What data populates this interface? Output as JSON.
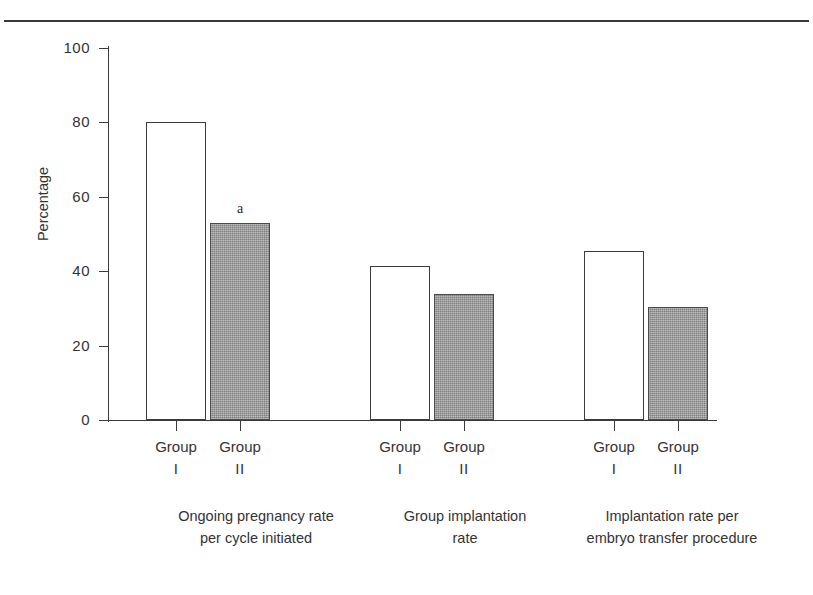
{
  "figure": {
    "y_axis_title": "Percentage",
    "y_ticks": [
      "100",
      "80",
      "60",
      "40",
      "20",
      "0"
    ],
    "group_label_line1": "Group",
    "group_label_roman_1": "I",
    "group_label_roman_2": "II",
    "note_marker": "a",
    "axis_color": "#3b3b3b",
    "bar_fill_open": "#ffffff",
    "bar_fill_shaded": "#9b9b9b",
    "series": [
      {
        "caption_line1": "Ongoing pregnancy rate",
        "caption_line2": "per cycle initiated",
        "bars": [
          {
            "label": "Group I",
            "value": 80.0,
            "style": "open",
            "note": ""
          },
          {
            "label": "Group II",
            "value": 53.0,
            "style": "filled",
            "note": "a"
          }
        ]
      },
      {
        "caption_line1": "Group implantation",
        "caption_line2": "rate",
        "bars": [
          {
            "label": "Group I",
            "value": 41.5,
            "style": "open",
            "note": ""
          },
          {
            "label": "Group II",
            "value": 33.8,
            "style": "filled",
            "note": ""
          }
        ]
      },
      {
        "caption_line1": "Implantation rate per",
        "caption_line2": "embryo transfer procedure",
        "bars": [
          {
            "label": "Group I",
            "value": 45.5,
            "style": "open",
            "note": ""
          },
          {
            "label": "Group II",
            "value": 30.5,
            "style": "filled",
            "note": ""
          }
        ]
      }
    ]
  },
  "chart_data": {
    "type": "bar",
    "title": "",
    "xlabel": "",
    "ylabel": "Percentage",
    "ylim": [
      0,
      100
    ],
    "yticks": [
      0,
      20,
      40,
      60,
      80,
      100
    ],
    "grid": false,
    "legend": "none",
    "categories": [
      "Ongoing pregnancy rate per cycle initiated",
      "Group implantation rate",
      "Implantation rate per embryo transfer procedure"
    ],
    "series": [
      {
        "name": "Group I",
        "values": [
          80.0,
          41.5,
          45.5
        ],
        "fill": "open"
      },
      {
        "name": "Group II",
        "values": [
          53.0,
          33.8,
          30.5
        ],
        "fill": "shaded-gray"
      }
    ],
    "annotations": [
      {
        "text": "a",
        "series": "Group II",
        "category": "Ongoing pregnancy rate per cycle initiated",
        "position": "above-bar"
      }
    ]
  }
}
